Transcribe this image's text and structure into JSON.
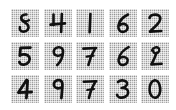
{
  "page": {
    "background_color": "#ffffff",
    "width": 176,
    "height": 110
  },
  "grid": {
    "rows": 3,
    "columns": 5,
    "tile_size_px": 28,
    "tile_background_color": "#b9b9b9",
    "ink_color": "#111111",
    "style": "handwritten-digit-thumbnail",
    "tiles": [
      {
        "row": 0,
        "col": 0,
        "digit": "8",
        "label": "eight"
      },
      {
        "row": 0,
        "col": 1,
        "digit": "4",
        "label": "four"
      },
      {
        "row": 0,
        "col": 2,
        "digit": "1",
        "label": "one"
      },
      {
        "row": 0,
        "col": 3,
        "digit": "6",
        "label": "six"
      },
      {
        "row": 0,
        "col": 4,
        "digit": "2",
        "label": "two"
      },
      {
        "row": 1,
        "col": 0,
        "digit": "5",
        "label": "five"
      },
      {
        "row": 1,
        "col": 1,
        "digit": "9",
        "label": "nine"
      },
      {
        "row": 1,
        "col": 2,
        "digit": "7",
        "label": "seven"
      },
      {
        "row": 1,
        "col": 3,
        "digit": "6",
        "label": "six"
      },
      {
        "row": 1,
        "col": 4,
        "digit": "2",
        "label": "two"
      },
      {
        "row": 2,
        "col": 0,
        "digit": "4",
        "label": "four"
      },
      {
        "row": 2,
        "col": 1,
        "digit": "9",
        "label": "nine"
      },
      {
        "row": 2,
        "col": 2,
        "digit": "7",
        "label": "seven"
      },
      {
        "row": 2,
        "col": 3,
        "digit": "3",
        "label": "three"
      },
      {
        "row": 2,
        "col": 4,
        "digit": "0",
        "label": "zero"
      }
    ],
    "rows_text": [
      "84162",
      "59762",
      "49730"
    ]
  }
}
